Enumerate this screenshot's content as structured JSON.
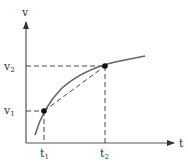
{
  "diagram": {
    "axes": {
      "y_label": "v",
      "x_label": "t"
    },
    "ticks": {
      "v1": {
        "base": "v",
        "sub": "1"
      },
      "v2": {
        "base": "v",
        "sub": "2"
      },
      "t1": {
        "base": "t",
        "sub": "1"
      },
      "t2": {
        "base": "t",
        "sub": "2"
      }
    },
    "points": [
      {
        "name": "P1",
        "t": "t1",
        "v": "v1"
      },
      {
        "name": "P2",
        "t": "t2",
        "v": "v2"
      }
    ],
    "colors": {
      "axis": "#555555",
      "curve": "#666666",
      "dash": "#444444",
      "point": "#111111",
      "text": "#333333"
    }
  }
}
